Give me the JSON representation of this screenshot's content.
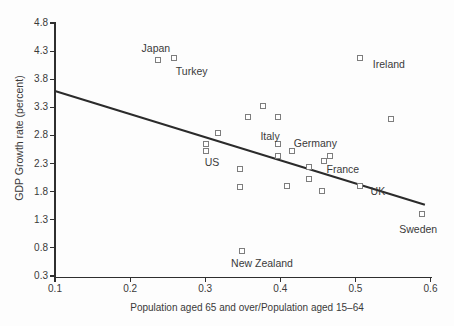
{
  "chart_data": {
    "type": "scatter",
    "title": "",
    "xlabel": "Population aged 65 and over/Population aged 15–64",
    "ylabel": "GDP Growth rate (percent)",
    "xlim": [
      0.1,
      0.6
    ],
    "ylim": [
      0.3,
      4.8
    ],
    "x_ticks": [
      "0.1",
      "0.2",
      "0.3",
      "0.4",
      "0.5",
      "0.6"
    ],
    "y_ticks": [
      "0.3",
      "0.8",
      "1.3",
      "1.8",
      "2.3",
      "2.8",
      "3.3",
      "3.8",
      "4.3",
      "4.8"
    ],
    "grid": false,
    "legend": false,
    "marker": "open-square",
    "points": [
      {
        "x": 0.237,
        "y": 4.15,
        "label": "Japan",
        "label_dx": -2,
        "label_dy": -12
      },
      {
        "x": 0.258,
        "y": 4.17,
        "label": "Turkey",
        "label_dx": 18,
        "label_dy": 13
      },
      {
        "x": 0.506,
        "y": 4.17,
        "label": "Ireland",
        "label_dx": 29,
        "label_dy": 6
      },
      {
        "x": 0.377,
        "y": 3.33,
        "label": ""
      },
      {
        "x": 0.357,
        "y": 3.13,
        "label": ""
      },
      {
        "x": 0.397,
        "y": 3.13,
        "label": ""
      },
      {
        "x": 0.548,
        "y": 3.1,
        "label": ""
      },
      {
        "x": 0.317,
        "y": 2.85,
        "label": ""
      },
      {
        "x": 0.301,
        "y": 2.64,
        "label": ""
      },
      {
        "x": 0.301,
        "y": 2.52,
        "label": "US",
        "label_dx": 6,
        "label_dy": 11
      },
      {
        "x": 0.397,
        "y": 2.64,
        "label": "Italy",
        "label_dx": -8,
        "label_dy": -8
      },
      {
        "x": 0.416,
        "y": 2.52,
        "label": "Germany",
        "label_dx": 23,
        "label_dy": -8
      },
      {
        "x": 0.397,
        "y": 2.43,
        "label": ""
      },
      {
        "x": 0.466,
        "y": 2.43,
        "label": ""
      },
      {
        "x": 0.458,
        "y": 2.34,
        "label": ""
      },
      {
        "x": 0.346,
        "y": 2.2,
        "label": ""
      },
      {
        "x": 0.438,
        "y": 2.23,
        "label": "France",
        "label_dx": 34,
        "label_dy": 2
      },
      {
        "x": 0.438,
        "y": 2.03,
        "label": ""
      },
      {
        "x": 0.346,
        "y": 1.88,
        "label": ""
      },
      {
        "x": 0.409,
        "y": 1.9,
        "label": ""
      },
      {
        "x": 0.456,
        "y": 1.82,
        "label": ""
      },
      {
        "x": 0.506,
        "y": 1.9,
        "label": "UK",
        "label_dx": 18,
        "label_dy": 5
      },
      {
        "x": 0.589,
        "y": 1.41,
        "label": "Sweden",
        "label_dx": -4,
        "label_dy": 15
      },
      {
        "x": 0.349,
        "y": 0.75,
        "label": "New Zealand",
        "label_dx": 20,
        "label_dy": 12
      }
    ],
    "trendline": {
      "x1": 0.1,
      "y1": 3.6,
      "x2": 0.592,
      "y2": 1.58
    }
  },
  "colors": {
    "background": "#fdfdfd",
    "axis": "#2f2f2f",
    "text": "#3a3a3a",
    "marker_border": "#7d7d7d",
    "trendline": "#2b2b2b"
  }
}
